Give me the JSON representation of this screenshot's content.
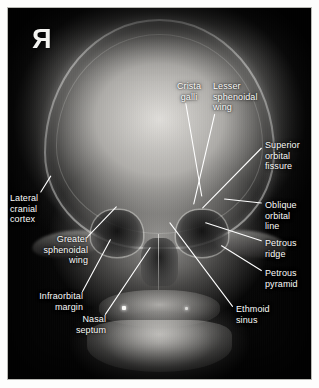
{
  "image": {
    "kind": "radiograph",
    "modality": "X-ray",
    "view": "posteroanterior-skull",
    "subject": "human skull",
    "side_marker": "R",
    "side_marker_note": "mirrored radiographic right-side marker",
    "background_color": "#050505",
    "bone_color": "#e4e2de",
    "label_color": "#fbfbf9",
    "leader_color": "#ffffff",
    "frame_color": "#fdfdfc",
    "frame_border_color": "#b9b9b4"
  },
  "annotations": [
    {
      "id": "crista-galli",
      "label": "Crista\ngalli",
      "align": "center",
      "x": 168,
      "y": 80,
      "leader": {
        "x1": 186,
        "y1": 103,
        "x2": 202,
        "y2": 196
      }
    },
    {
      "id": "lesser-sphenoidal-wing",
      "label": "Lesser\nsphenoidal\nwing",
      "align": "left",
      "x": 212,
      "y": 80,
      "leader": {
        "x1": 215,
        "y1": 114,
        "x2": 194,
        "y2": 204
      }
    },
    {
      "id": "superior-orbital-fissure",
      "label": "Superior\norbital\nfissure",
      "align": "left",
      "x": 264,
      "y": 139,
      "leader": {
        "x1": 262,
        "y1": 148,
        "x2": 203,
        "y2": 208
      }
    },
    {
      "id": "oblique-orbital-line",
      "label": "Oblique\norbital\nline",
      "align": "left",
      "x": 264,
      "y": 199,
      "leader": {
        "x1": 262,
        "y1": 203,
        "x2": 225,
        "y2": 199
      }
    },
    {
      "id": "petrous-ridge",
      "label": "Petrous\nridge",
      "align": "left",
      "x": 264,
      "y": 237,
      "leader": {
        "x1": 262,
        "y1": 241,
        "x2": 206,
        "y2": 223
      }
    },
    {
      "id": "petrous-pyramid",
      "label": "Petrous\npyramid",
      "align": "left",
      "x": 264,
      "y": 267,
      "leader": {
        "x1": 262,
        "y1": 271,
        "x2": 222,
        "y2": 246
      }
    },
    {
      "id": "ethmoid-sinus",
      "label": "Ethmoid\nsinus",
      "align": "left",
      "x": 235,
      "y": 303,
      "leader": {
        "x1": 233,
        "y1": 307,
        "x2": 170,
        "y2": 223
      }
    },
    {
      "id": "lateral-cranial-cortex",
      "label": "Lateral\ncranial\ncortex",
      "align": "left",
      "x": 9,
      "y": 192,
      "leader": {
        "x1": 40,
        "y1": 192,
        "x2": 50,
        "y2": 176
      }
    },
    {
      "id": "greater-sphenoidal-wing",
      "label": "Greater\nsphenoidal\nwing",
      "align": "right",
      "x": 13,
      "y": 233,
      "leader": {
        "x1": 87,
        "y1": 237,
        "x2": 116,
        "y2": 207
      }
    },
    {
      "id": "infraorbital-margin",
      "label": "Infraorbital\nmargin",
      "align": "right",
      "x": 11,
      "y": 290,
      "leader": {
        "x1": 82,
        "y1": 292,
        "x2": 110,
        "y2": 240
      }
    },
    {
      "id": "nasal-septum",
      "label": "Nasal\nseptum",
      "align": "right",
      "x": 53,
      "y": 313,
      "leader": {
        "x1": 105,
        "y1": 315,
        "x2": 150,
        "y2": 248
      }
    }
  ]
}
